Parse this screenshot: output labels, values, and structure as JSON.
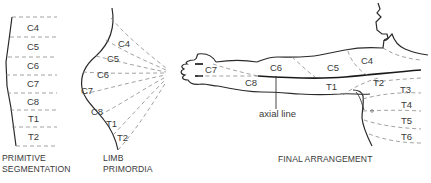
{
  "panels": {
    "primitive": {
      "caption_line1": "PRIMITIVE",
      "caption_line2": "SEGMENTATION",
      "segments": [
        "C4",
        "C5",
        "C6",
        "C7",
        "C8",
        "T1",
        "T2"
      ]
    },
    "limb": {
      "caption_line1": "LIMB",
      "caption_line2": "PRIMORDIA",
      "segments": [
        "C4",
        "C5",
        "C6",
        "C7",
        "C8",
        "T1",
        "T2"
      ]
    },
    "final": {
      "caption": "FINAL  ARRANGEMENT",
      "axial_label": "axial line",
      "arm_segments": [
        "C7",
        "C6",
        "C8",
        "C5",
        "C4",
        "T1",
        "T2"
      ],
      "trunk_segments": [
        "T3",
        "T4",
        "T5",
        "T6"
      ]
    }
  },
  "colors": {
    "line": "#2a2a2a",
    "dash": "#8a8a8a",
    "text": "#3a3a3a"
  }
}
